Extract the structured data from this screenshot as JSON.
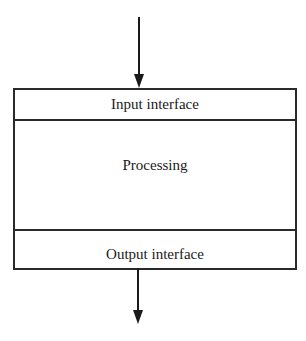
{
  "diagram": {
    "sections": [
      {
        "label": "Input interface"
      },
      {
        "label": "Processing"
      },
      {
        "label": "Output interface"
      }
    ],
    "arrows": [
      {
        "direction": "down",
        "role": "input"
      },
      {
        "direction": "down",
        "role": "output"
      }
    ]
  }
}
